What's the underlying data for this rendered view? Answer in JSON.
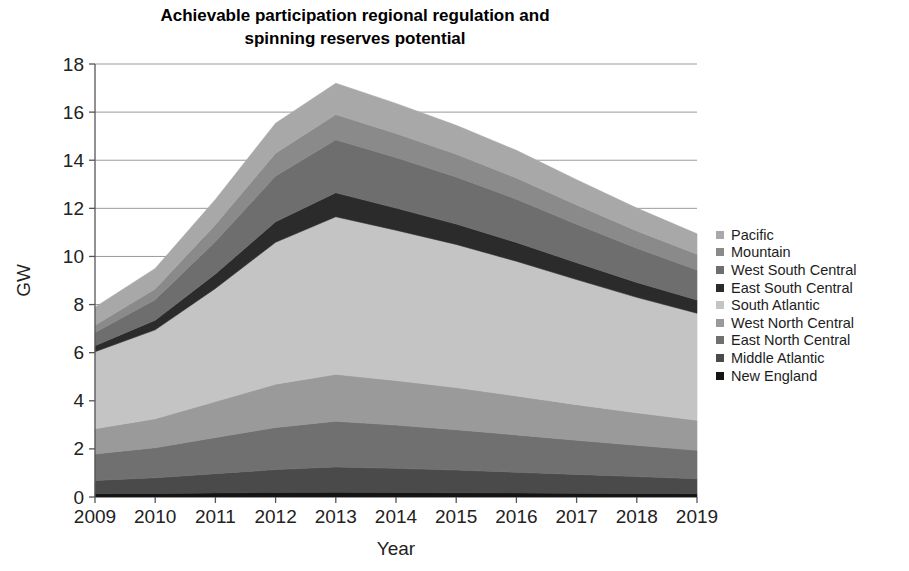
{
  "chart_data": {
    "type": "area",
    "stacked": true,
    "title": "Achievable participation regional regulation and spinning reserves potential",
    "title_lines": [
      "Achievable participation regional regulation and",
      "spinning reserves potential"
    ],
    "xlabel": "Year",
    "ylabel": "GW",
    "x": [
      2009,
      2010,
      2011,
      2012,
      2013,
      2014,
      2015,
      2016,
      2017,
      2018,
      2019
    ],
    "categories": [
      "2009",
      "2010",
      "2011",
      "2012",
      "2013",
      "2014",
      "2015",
      "2016",
      "2017",
      "2018",
      "2019"
    ],
    "xlim": [
      2009,
      2019
    ],
    "ylim": [
      0,
      18
    ],
    "yticks": [
      0,
      2,
      4,
      6,
      8,
      10,
      12,
      14,
      16,
      18
    ],
    "ytick_labels": [
      "0",
      "2",
      "4",
      "6",
      "8",
      "10",
      "12",
      "14",
      "16",
      "18"
    ],
    "grid": "horizontal",
    "legend_position": "right",
    "stack_order_bottom_to_top": [
      "New England",
      "Middle Atlantic",
      "East North Central",
      "West North Central",
      "South Atlantic",
      "East South Central",
      "West South Central",
      "Mountain",
      "Pacific"
    ],
    "series": [
      {
        "name": "Pacific",
        "color": "#a8a8a8",
        "values": [
          0.75,
          0.85,
          1.05,
          1.25,
          1.3,
          1.25,
          1.2,
          1.15,
          1.05,
          0.95,
          0.85
        ]
      },
      {
        "name": "Mountain",
        "color": "#8a8a8a",
        "values": [
          0.3,
          0.45,
          0.7,
          0.95,
          1.05,
          1.0,
          0.95,
          0.88,
          0.8,
          0.72,
          0.65
        ]
      },
      {
        "name": "West South Central",
        "color": "#6e6e6e",
        "values": [
          0.55,
          0.85,
          1.35,
          1.9,
          2.2,
          2.1,
          1.95,
          1.8,
          1.6,
          1.42,
          1.25
        ]
      },
      {
        "name": "East South Central",
        "color": "#2b2b2b",
        "values": [
          0.25,
          0.4,
          0.6,
          0.85,
          1.0,
          0.92,
          0.85,
          0.78,
          0.7,
          0.62,
          0.55
        ]
      },
      {
        "name": "South Atlantic",
        "color": "#c4c4c4",
        "values": [
          3.2,
          3.7,
          4.7,
          5.9,
          6.55,
          6.25,
          5.95,
          5.6,
          5.2,
          4.8,
          4.45
        ]
      },
      {
        "name": "West North Central",
        "color": "#9a9a9a",
        "values": [
          1.05,
          1.2,
          1.5,
          1.8,
          1.95,
          1.85,
          1.75,
          1.62,
          1.48,
          1.35,
          1.25
        ]
      },
      {
        "name": "East North Central",
        "color": "#707070",
        "values": [
          1.1,
          1.25,
          1.5,
          1.75,
          1.9,
          1.8,
          1.68,
          1.55,
          1.42,
          1.3,
          1.18
        ]
      },
      {
        "name": "Middle Atlantic",
        "color": "#4a4a4a",
        "values": [
          0.55,
          0.65,
          0.8,
          0.95,
          1.05,
          1.0,
          0.94,
          0.86,
          0.78,
          0.7,
          0.62
        ]
      },
      {
        "name": "New England",
        "color": "#141414",
        "values": [
          0.14,
          0.15,
          0.17,
          0.19,
          0.2,
          0.19,
          0.18,
          0.17,
          0.16,
          0.15,
          0.14
        ]
      }
    ],
    "totals": [
      7.89,
      9.5,
      12.37,
      15.54,
      17.2,
      16.36,
      15.45,
      14.41,
      13.19,
      12.01,
      10.94
    ]
  },
  "legend": {
    "items": [
      {
        "label": "Pacific",
        "color": "#a8a8a8"
      },
      {
        "label": "Mountain",
        "color": "#8a8a8a"
      },
      {
        "label": "West South Central",
        "color": "#6e6e6e"
      },
      {
        "label": "East South Central",
        "color": "#2b2b2b"
      },
      {
        "label": "South Atlantic",
        "color": "#c4c4c4"
      },
      {
        "label": "West North Central",
        "color": "#9a9a9a"
      },
      {
        "label": "East North Central",
        "color": "#707070"
      },
      {
        "label": "Middle Atlantic",
        "color": "#4a4a4a"
      },
      {
        "label": "New England",
        "color": "#141414"
      }
    ]
  },
  "colors": {
    "axis": "#555555",
    "grid": "#9a9a9a",
    "text": "#1d1d1d",
    "background": "#ffffff"
  }
}
